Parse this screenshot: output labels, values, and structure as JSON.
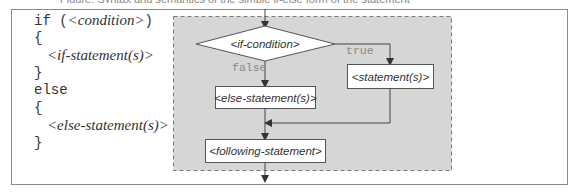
{
  "caption": "Figure: Syntax and semantics of the simple if-else form of the statement",
  "code": {
    "lines": [
      {
        "kw": "if (",
        "placeholder": "<condition>",
        "tail": ")"
      },
      {
        "kw": "{",
        "placeholder": "",
        "tail": ""
      },
      {
        "kw": "",
        "placeholder": "<if-statement(s)>",
        "tail": ""
      },
      {
        "kw": "}",
        "placeholder": "",
        "tail": ""
      },
      {
        "kw": "else",
        "placeholder": "",
        "tail": ""
      },
      {
        "kw": "{",
        "placeholder": "",
        "tail": ""
      },
      {
        "kw": "",
        "placeholder": "<else-statement(s)>",
        "tail": ""
      },
      {
        "kw": "}",
        "placeholder": "",
        "tail": ""
      }
    ]
  },
  "flowchart": {
    "condition": "<if-condition>",
    "true_label": "true",
    "false_label": "false",
    "true_box": "<statement(s)>",
    "false_box": "<else-statement(s)>",
    "following_box": "<following-statement>",
    "colors": {
      "region_fill": "#d6d6d6",
      "region_border": "#7a7a7a",
      "box_fill": "#ffffff",
      "line": "#444444"
    }
  }
}
